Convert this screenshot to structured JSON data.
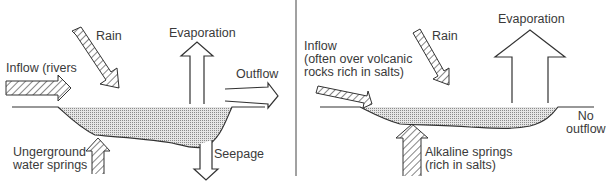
{
  "left_panel": {
    "labels": {
      "rain": "Rain",
      "evaporation": "Evaporation",
      "inflow": "Inflow (rivers",
      "outflow": "Outflow",
      "springs": "Ungerground\nwater springs",
      "seepage": "Seepage"
    }
  },
  "right_panel": {
    "labels": {
      "rain": "Rain",
      "evaporation": "Evaporation",
      "inflow": "Inflow\n(often over volcanic\nrocks rich in salts)",
      "no_outflow": "No\noutflow",
      "springs": "Alkaline springs\n(rich in salts)"
    }
  },
  "colors": {
    "ink": "#333333",
    "water": "#bdbdbd"
  }
}
